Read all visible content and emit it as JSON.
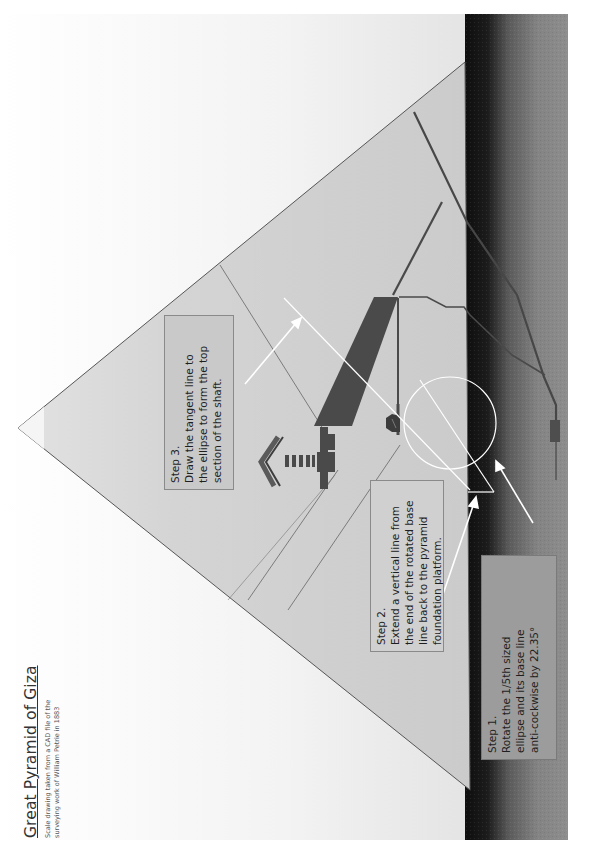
{
  "title_block": {
    "title": "Great Pyramid of Giza",
    "subtitle_line1": "Scale drawing taken from a CAD file of the",
    "subtitle_line2": "surveying work of William Petrie in 1883"
  },
  "steps": {
    "step1": {
      "heading": "Step 1.",
      "lines": [
        "Rotate  the 1/5th sized",
        "ellipse and its base line",
        "anti-cockwise by 22.35°"
      ]
    },
    "step2": {
      "heading": "Step 2.",
      "lines": [
        "Extend a vertical line from",
        "the end of the rotated base",
        "line back to the pyramid",
        "foundation platform."
      ]
    },
    "step3": {
      "heading": "Step 3.",
      "lines": [
        "Draw the tangent line to",
        "the ellipse to form the top",
        "section of the shaft."
      ]
    }
  },
  "colors": {
    "pyramid_fill": "#cfcfcf",
    "pyramid_edge": "#555555",
    "chamber_fill": "#4a4a4a",
    "construction_white": "#ffffff",
    "ground_dark": "#1a1a1a",
    "ground_mid": "#7a7a7a"
  },
  "geometry_notes": {
    "rotation_angle": "22.35°",
    "ellipse_scale": "1/5th"
  }
}
